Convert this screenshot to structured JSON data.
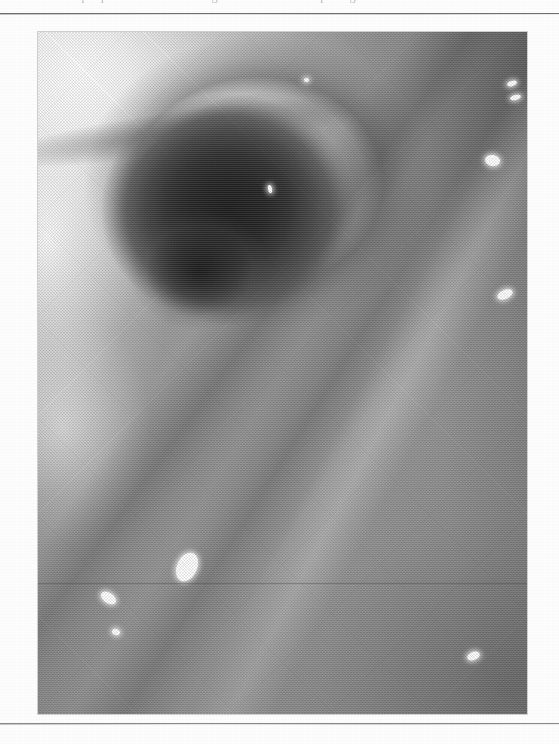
{
  "page": {
    "width_px": 559,
    "height_px": 744,
    "background_color": "#fdfdfd",
    "kind": "scanned printed page"
  },
  "caption": {
    "text": "of a plaque is seen in the margin of the fistulous opening.",
    "note": "top caption line is cropped by the page edge; only descenders are visible",
    "color": "#8d8d8d"
  },
  "rules": {
    "top": {
      "y_px": 13,
      "color": "#6f6f6f"
    },
    "bottom": {
      "y_px": 723,
      "color": "#8a8a8a"
    }
  },
  "photo": {
    "title": "Endoscopic photograph",
    "kind": "halftone-printed grayscale medical photograph",
    "left_px": 38,
    "top_px": 32,
    "width_px": 489,
    "height_px": 682,
    "frame_color": "#8a8a8a",
    "tone_range": {
      "darkest": "#1d1d1d",
      "lightest": "#ffffff",
      "midtone": "#9a9a9a"
    },
    "description": "Close-up endoscopic view of a mucosal surface. A large dark cavity or fistulous opening dominates the upper-center. The upper-left is strongly over-exposed and nearly white. Diagonal tissue folds run from the lower-left toward the upper-right. Several small bright specular reflections from the endoscope light are scattered across the surface.",
    "regions": [
      {
        "name": "over-exposed upper-left highlight",
        "tone": "#fdfdfd"
      },
      {
        "name": "dark cavity / lumen",
        "tone": "#1d1d1d"
      },
      {
        "name": "shadowed rim fold above cavity",
        "tone": "#4a4a4a"
      },
      {
        "name": "mid-gray mucosal wall",
        "tone": "#9e9e9e"
      },
      {
        "name": "lower flat mucosa",
        "tone": "#8c8c8c"
      },
      {
        "name": "darkened bottom-right corner",
        "tone": "#7a7a7a"
      }
    ],
    "highlights": [
      {
        "name": "highlight-top-right-a",
        "x_pct": 97.0,
        "y_pct": 7.5,
        "w_px": 10,
        "h_px": 5,
        "rot_deg": -18
      },
      {
        "name": "highlight-top-right-b",
        "x_pct": 97.6,
        "y_pct": 9.6,
        "w_px": 11,
        "h_px": 5,
        "rot_deg": -14
      },
      {
        "name": "highlight-right-mid",
        "x_pct": 93.0,
        "y_pct": 18.8,
        "w_px": 15,
        "h_px": 11,
        "rot_deg": 10
      },
      {
        "name": "highlight-right-low",
        "x_pct": 95.5,
        "y_pct": 38.5,
        "w_px": 16,
        "h_px": 9,
        "rot_deg": -24
      },
      {
        "name": "highlight-center-low",
        "x_pct": 30.5,
        "y_pct": 78.5,
        "w_px": 20,
        "h_px": 30,
        "rot_deg": 24
      },
      {
        "name": "highlight-left-low",
        "x_pct": 14.5,
        "y_pct": 83.0,
        "w_px": 17,
        "h_px": 10,
        "rot_deg": 34
      },
      {
        "name": "highlight-left-small",
        "x_pct": 16.0,
        "y_pct": 88.0,
        "w_px": 8,
        "h_px": 6,
        "rot_deg": 20
      },
      {
        "name": "highlight-right-bottom",
        "x_pct": 89.0,
        "y_pct": 91.5,
        "w_px": 13,
        "h_px": 8,
        "rot_deg": -20
      },
      {
        "name": "highlight-cavity-fleck",
        "x_pct": 47.5,
        "y_pct": 23.0,
        "w_px": 4,
        "h_px": 8,
        "rot_deg": -12
      },
      {
        "name": "highlight-upper-edge",
        "x_pct": 55.0,
        "y_pct": 7.0,
        "w_px": 5,
        "h_px": 4,
        "rot_deg": 0
      }
    ],
    "artifacts": [
      {
        "name": "scanner-seam-line",
        "y_pct": 80.8
      }
    ]
  }
}
